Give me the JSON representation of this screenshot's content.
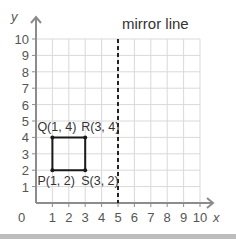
{
  "title": "mirror line",
  "axes": {
    "x_label": "x",
    "y_label": "y",
    "origin_label": "0",
    "x_ticks": [
      "1",
      "2",
      "3",
      "4",
      "5",
      "6",
      "7",
      "8",
      "9",
      "10"
    ],
    "y_ticks": [
      "1",
      "2",
      "3",
      "4",
      "5",
      "6",
      "7",
      "8",
      "9",
      "10"
    ]
  },
  "points": [
    {
      "name": "P",
      "label": "P(1, 2)",
      "x": 1,
      "y": 2
    },
    {
      "name": "Q",
      "label": "Q(1, 4)",
      "x": 1,
      "y": 4
    },
    {
      "name": "R",
      "label": "R(3, 4)",
      "x": 3,
      "y": 4
    },
    {
      "name": "S",
      "label": "S(3, 2)",
      "x": 3,
      "y": 2
    }
  ],
  "mirror_line": {
    "x": 5,
    "style": "dashed"
  },
  "colors": {
    "grid": "#d9d9d9",
    "axis": "#8c8c8c",
    "shape": "#1a1a1a",
    "text": "#333333"
  }
}
